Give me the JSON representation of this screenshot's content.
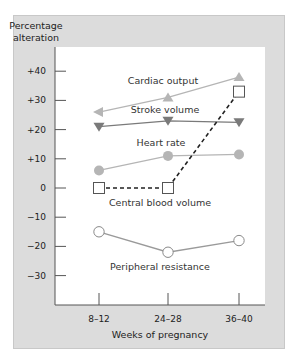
{
  "chart_data": {
    "type": "line",
    "title": "",
    "ylabel": "Percentage alteration",
    "xlabel": "Weeks of pregnancy",
    "categories": [
      "8–12",
      "24–28",
      "36–40"
    ],
    "yticks": [
      40,
      30,
      20,
      10,
      0,
      -10,
      -20,
      -30
    ],
    "ytick_labels": [
      "+40",
      "+30",
      "+20",
      "+10",
      "0",
      "−10",
      "−20",
      "−30"
    ],
    "ylim": [
      -40,
      44
    ],
    "grid": false,
    "legend": "inline labels",
    "series": [
      {
        "name": "Cardiac output",
        "values": [
          26,
          31,
          38
        ],
        "marker": "triangle-up",
        "first_marker": "arrow-left",
        "color": "#b5b5b5",
        "line": "solid"
      },
      {
        "name": "Stroke volume",
        "values": [
          21,
          23,
          22.5
        ],
        "marker": "triangle-down",
        "color": "#7a7a7a",
        "line": "solid"
      },
      {
        "name": "Heart rate",
        "values": [
          6,
          11,
          11.5
        ],
        "marker": "circle-filled",
        "color": "#b5b5b5",
        "line": "solid"
      },
      {
        "name": "Central blood volume",
        "values": [
          0,
          0,
          33
        ],
        "marker": "square-open",
        "color": "#333333",
        "line": "dashed"
      },
      {
        "name": "Peripheral resistance",
        "values": [
          -15,
          -22,
          -18
        ],
        "marker": "circle-open",
        "color": "#9a9a9a",
        "line": "solid"
      }
    ]
  },
  "labels": {
    "y_title_line1": "Percentage",
    "y_title_line2": "alteration",
    "x_title": "Weeks of pregnancy",
    "cardiac_output": "Cardiac output",
    "stroke_volume": "Stroke volume",
    "heart_rate": "Heart rate",
    "central_blood_volume": "Central blood volume",
    "peripheral_resistance": "Peripheral resistance"
  }
}
